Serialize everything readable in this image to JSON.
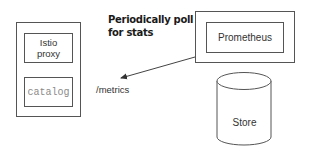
{
  "diagram": {
    "pod": {
      "istio_proxy_label_line1": "Istio",
      "istio_proxy_label_line2": "proxy",
      "catalog_label": "catalog"
    },
    "metrics_endpoint_label": "/metrics",
    "annotation": {
      "line1": "Periodically poll",
      "line2": "for stats"
    },
    "prometheus": {
      "label": "Prometheus"
    },
    "store": {
      "label": "Store"
    },
    "colors": {
      "stroke": "#555555",
      "catalog_text": "#8a8a8a",
      "background": "#ffffff"
    }
  }
}
